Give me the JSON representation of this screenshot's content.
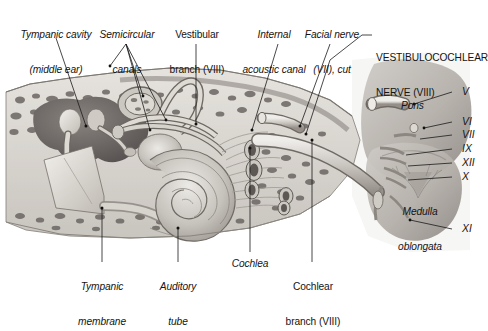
{
  "figure": {
    "title_label": "VESTIBULOCOCHLEAR NERVE (VIII)",
    "background_color": "#ffffff",
    "ink_color": "#141414",
    "bone_color": "#d8d5cf",
    "cavity_color": "#6f6a66"
  },
  "labels": {
    "tympanic_cavity_l1": "Tympanic cavity",
    "tympanic_cavity_l2": "(middle ear)",
    "semicircular_l1": "Semicircular",
    "semicircular_l2": "canals",
    "vestibular_branch_l1": "Vestibular",
    "vestibular_branch_l2": "branch (VIII)",
    "internal_acoustic_l1": "Internal",
    "internal_acoustic_l2": "acoustic canal",
    "facial_nerve_l1": "Facial nerve",
    "facial_nerve_l2": "(VII), cut",
    "vestibulocochlear_l1": "VESTIBULOCOCHLEAR",
    "vestibulocochlear_l2": "NERVE (VIII)",
    "pons": "Pons",
    "medulla_l1": "Medulla",
    "medulla_l2": "oblongata",
    "tympanic_membrane_l1": "Tympanic",
    "tympanic_membrane_l2": "membrane",
    "auditory_tube_l1": "Auditory",
    "auditory_tube_l2": "tube",
    "cochlea": "Cochlea",
    "cochlear_branch_l1": "Cochlear",
    "cochlear_branch_l2": "branch (VIII)"
  },
  "cranial_nerves": [
    {
      "numeral": "V",
      "y": 92
    },
    {
      "numeral": "VI",
      "y": 122
    },
    {
      "numeral": "VII",
      "y": 135
    },
    {
      "numeral": "IX",
      "y": 149
    },
    {
      "numeral": "XII",
      "y": 163
    },
    {
      "numeral": "X",
      "y": 177
    },
    {
      "numeral": "XI",
      "y": 229
    }
  ]
}
